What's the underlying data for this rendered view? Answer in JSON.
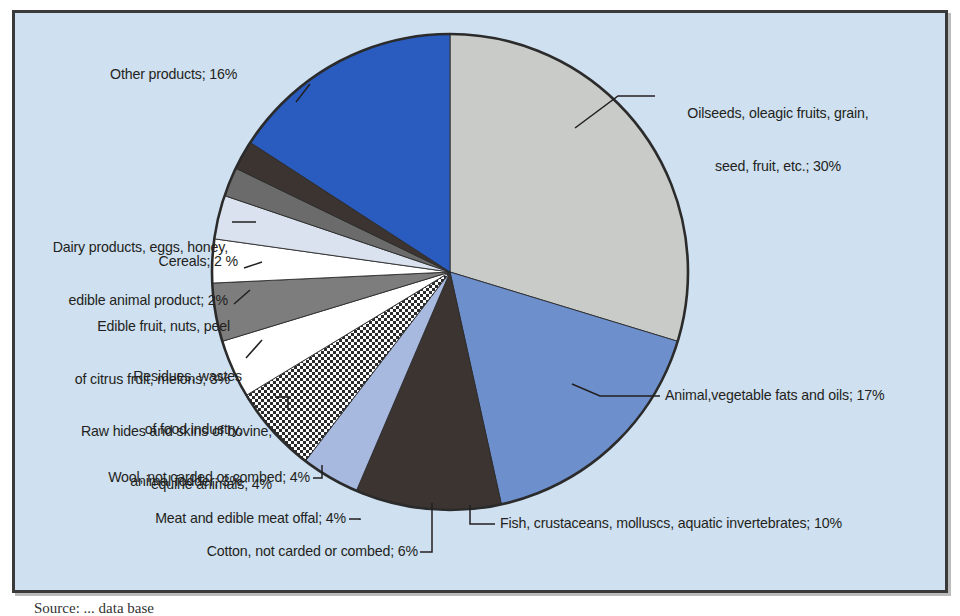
{
  "figure": {
    "background_color": "#cfe0f0",
    "border_color": "#3a3a3a",
    "page_color": "#ffffff",
    "caption": "Source: ... data base"
  },
  "chart_data": {
    "type": "pie",
    "title": "",
    "subtitle": "",
    "xlabel": "",
    "ylabel": "",
    "legend_position": "none",
    "grid": false,
    "units": "percent",
    "total": 101,
    "start_angle_deg": -90,
    "direction": "clockwise",
    "categories": [
      "Oilseeds, oleagic fruits, grain, seed, fruit, etc.",
      "Animal,vegetable fats and oils",
      "Fish, crustaceans, molluscs, aquatic invertebrates",
      "Meat and edible meat offal",
      "Cotton, not carded or combed",
      "Wool, not carded or combed",
      "Raw hides and skins of bovine, equine animals",
      "Residues, wastes of food industry, animal fodder",
      "Edible fruit, nuts, peel of citrus fruit, melons",
      "Cereals",
      "Dairy products, eggs, honey, edible animal product",
      "Other products"
    ],
    "values": [
      30,
      17,
      10,
      4,
      6,
      4,
      4,
      3,
      3,
      2,
      2,
      16
    ],
    "colors": [
      "#c9cbc9",
      "#6d8fcc",
      "#3b3431",
      "#a8b9e0",
      "#hatch",
      "#ffffff",
      "#7d7d7d",
      "#ffffff",
      "#d9e2ee",
      "#6b6b6b",
      "#3b3431",
      "#2a5cbf"
    ],
    "slices": [
      {
        "label": "Oilseeds, oleagic fruits, grain, seed, fruit, etc.",
        "value": 30,
        "value_text": "30%",
        "color": "#c9cbc9",
        "pattern": "solid"
      },
      {
        "label": "Animal,vegetable fats and oils",
        "value": 17,
        "value_text": "17%",
        "color": "#6d8fcc",
        "pattern": "solid"
      },
      {
        "label": "Fish, crustaceans, molluscs, aquatic invertebrates",
        "value": 10,
        "value_text": "10%",
        "color": "#3b3431",
        "pattern": "solid"
      },
      {
        "label": "Meat and edible meat offal",
        "value": 4,
        "value_text": "4%",
        "color": "#a8b9e0",
        "pattern": "solid"
      },
      {
        "label": "Cotton, not carded or combed",
        "value": 6,
        "value_text": "6%",
        "color": "#ffffff",
        "pattern": "checker"
      },
      {
        "label": "Wool, not carded or combed",
        "value": 4,
        "value_text": "4%",
        "color": "#ffffff",
        "pattern": "solid"
      },
      {
        "label": "Raw hides and skins of bovine, equine animals",
        "value": 4,
        "value_text": "4%",
        "color": "#7d7d7d",
        "pattern": "solid"
      },
      {
        "label": "Residues, wastes of food industry, animal fodder",
        "value": 3,
        "value_text": "3%",
        "color": "#ffffff",
        "pattern": "solid"
      },
      {
        "label": "Edible fruit, nuts, peel of citrus fruit, melons",
        "value": 3,
        "value_text": "3%",
        "color": "#d9e2ee",
        "pattern": "solid"
      },
      {
        "label": "Cereals",
        "value": 2,
        "value_text": "2 %",
        "color": "#6b6b6b",
        "pattern": "solid"
      },
      {
        "label": "Dairy products, eggs, honey, edible animal product",
        "value": 2,
        "value_text": "2%",
        "color": "#3b3431",
        "pattern": "solid"
      },
      {
        "label": "Other products",
        "value": 16,
        "value_text": "16%",
        "color": "#2a5cbf",
        "pattern": "solid"
      }
    ]
  },
  "labels": {
    "oilseeds_line1": "Oilseeds, oleagic fruits, grain,",
    "oilseeds_line2": "seed, fruit, etc.; 30%",
    "fats_oils": "Animal,vegetable fats and oils; 17%",
    "fish": "Fish, crustaceans, molluscs, aquatic invertebrates; 10%",
    "cotton": "Cotton, not carded or combed; 6%",
    "meat": "Meat and edible meat offal; 4%",
    "wool": "Wool, not carded or combed; 4%",
    "hides_line1": "Raw hides and skins of bovine,",
    "hides_line2": "equine animals; 4%",
    "residues_line1": "Residues, wastes",
    "residues_line2": "of food industry,",
    "residues_line3": "animal fodder; 3%",
    "fruit_line1": "Edible fruit, nuts, peel",
    "fruit_line2": "of citrus fruit, melons; 3%",
    "cereals": "Cereals; 2 %",
    "dairy_line1": "Dairy products, eggs, honey,",
    "dairy_line2": "edible animal product; 2%",
    "other": "Other products; 16%"
  }
}
